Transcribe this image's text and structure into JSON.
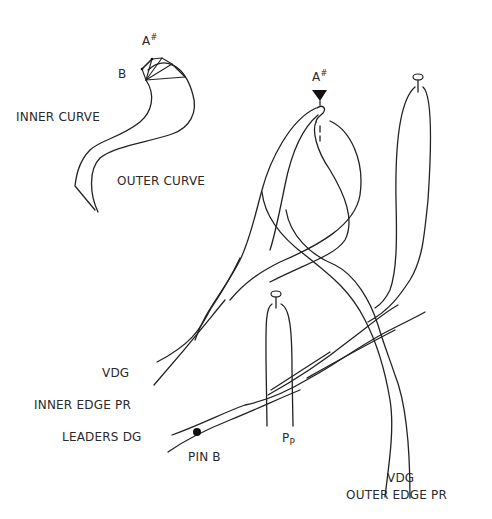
{
  "figure": {
    "type": "bobbin lace thread diagram",
    "left_inset": {
      "labels": {
        "a_sharp": "A",
        "a_sharp_sup": "#",
        "b": "B",
        "inner_curve": "INNER CURVE",
        "outer_curve": "OUTER CURVE"
      }
    },
    "main": {
      "labels": {
        "a_sharp": "A",
        "a_sharp_sup": "#",
        "vdg_left": "VDG",
        "inner_edge_pr": "INNER EDGE PR",
        "leaders_dg": "LEADERS DG",
        "pin_b": "PIN B",
        "pp_main": "P",
        "pp_sub": "P",
        "vdg_right": "VDG",
        "outer_edge_pr": "OUTER EDGE PR"
      }
    },
    "colors": {
      "line": "#222222",
      "background": "#ffffff",
      "text": "#2a2a2a"
    }
  }
}
